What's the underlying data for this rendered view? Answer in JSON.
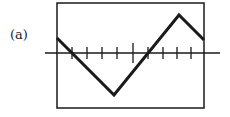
{
  "figure": {
    "label": "(a)",
    "window": {
      "x": 57,
      "y": 3,
      "width": 147,
      "height": 105
    },
    "axis": {
      "y": 53,
      "x1": 45,
      "x2": 220
    },
    "ticks": [
      {
        "x": 72,
        "long": false
      },
      {
        "x": 87,
        "long": false
      },
      {
        "x": 102,
        "long": false
      },
      {
        "x": 117,
        "long": false
      },
      {
        "x": 133,
        "long": true
      },
      {
        "x": 148,
        "long": false
      },
      {
        "x": 163,
        "long": false
      },
      {
        "x": 177,
        "long": false
      },
      {
        "x": 191,
        "long": false
      }
    ],
    "graph_points": [
      [
        57,
        38
      ],
      [
        114,
        95
      ],
      [
        179,
        15
      ],
      [
        204,
        40
      ]
    ],
    "stroke_color": "#1a1a1a"
  }
}
